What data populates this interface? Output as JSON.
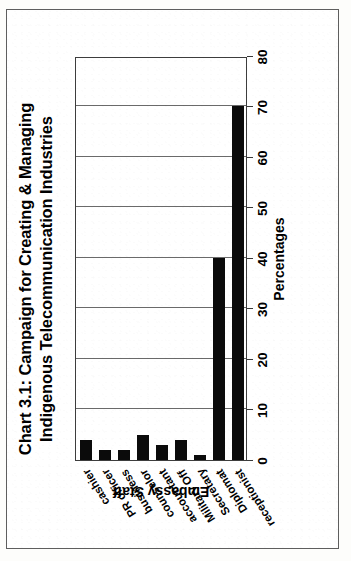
{
  "chart_data": {
    "type": "bar",
    "orientation": "vertical",
    "title": "Chart 3.1: Campaign for Creating & Managing Indigenous Telecommunication Industries",
    "title_line1": "Chart 3.1: Campaign for Creating & Managing",
    "title_line2": "Indigenous Telecommunication Industries",
    "xlabel": "Embassy Staff",
    "ylabel": "Percentages",
    "categories": [
      "cashier",
      "PR officer",
      "business",
      "counselor",
      "accountant",
      "Military Off",
      "Secretary",
      "Diplomat",
      "receptionist"
    ],
    "values": [
      4,
      2,
      2,
      5,
      3,
      4,
      1,
      40,
      70
    ],
    "ylim": [
      0,
      80
    ],
    "yticks": [
      0,
      10,
      20,
      30,
      40,
      50,
      60,
      70,
      80
    ],
    "ytick_labels": [
      "0",
      "10",
      "20",
      "30",
      "40",
      "50",
      "60",
      "70",
      "80"
    ],
    "grid": true,
    "legend": false,
    "bar_color": "#0b0b0b",
    "rotation_deg": -90
  },
  "page": {
    "background_color": "#ffffff",
    "border_color": "#5e5e5e"
  }
}
